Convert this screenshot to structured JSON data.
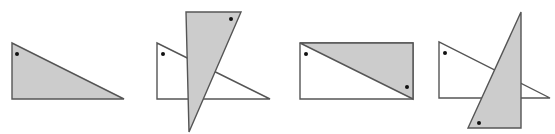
{
  "colors": {
    "shaded_fill": "#cccccc",
    "unshaded_fill": "#ffffff",
    "stroke": "#555555",
    "dot": "#111111"
  },
  "figures": [
    {
      "id": "figure-1",
      "description": "single shaded right triangle",
      "shapes": [
        {
          "type": "polygon",
          "fill": "shaded",
          "points": "12,43 12,99 124,99"
        }
      ],
      "dots": [
        {
          "cx": 17,
          "cy": 54
        }
      ]
    },
    {
      "id": "figure-2",
      "description": "white right triangle overlapped by tall shaded triangle",
      "shapes": [
        {
          "type": "polygon",
          "fill": "unshaded",
          "points": "157,43 157,99 270,99"
        },
        {
          "type": "polygon",
          "fill": "shaded",
          "points": "186,12 241,12 189,132"
        }
      ],
      "dots": [
        {
          "cx": 163,
          "cy": 54
        },
        {
          "cx": 231,
          "cy": 19
        }
      ]
    },
    {
      "id": "figure-3",
      "description": "rectangle split by diagonal, upper-right half shaded",
      "shapes": [
        {
          "type": "polygon",
          "fill": "unshaded",
          "points": "300,43 413,43 413,99 300,99"
        },
        {
          "type": "polygon",
          "fill": "shaded",
          "points": "300,43 413,43 413,99"
        }
      ],
      "dots": [
        {
          "cx": 306,
          "cy": 54
        },
        {
          "cx": 407,
          "cy": 87
        }
      ]
    },
    {
      "id": "figure-4",
      "description": "white right triangle overlapped by tall shaded right triangle",
      "shapes": [
        {
          "type": "polygon",
          "fill": "unshaded",
          "points": "439,42 439,98 550,98"
        },
        {
          "type": "polygon",
          "fill": "shaded",
          "points": "521,12 521,128 468,128"
        }
      ],
      "dots": [
        {
          "cx": 445,
          "cy": 53
        },
        {
          "cx": 479,
          "cy": 123
        }
      ]
    }
  ]
}
